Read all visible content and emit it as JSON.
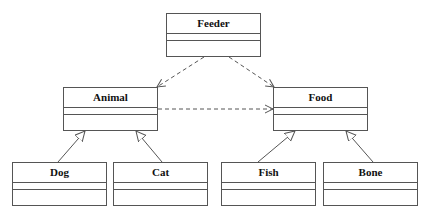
{
  "diagram": {
    "type": "UML class diagram",
    "classes": [
      {
        "id": "feeder",
        "name": "Feeder",
        "x": 166,
        "y": 13,
        "w": 95,
        "h": 44
      },
      {
        "id": "animal",
        "name": "Animal",
        "x": 63,
        "y": 87,
        "w": 95,
        "h": 44
      },
      {
        "id": "food",
        "name": "Food",
        "x": 273,
        "y": 87,
        "w": 95,
        "h": 44
      },
      {
        "id": "dog",
        "name": "Dog",
        "x": 12,
        "y": 162,
        "w": 95,
        "h": 44
      },
      {
        "id": "cat",
        "name": "Cat",
        "x": 113,
        "y": 162,
        "w": 95,
        "h": 44
      },
      {
        "id": "fish",
        "name": "Fish",
        "x": 221,
        "y": 162,
        "w": 95,
        "h": 44
      },
      {
        "id": "bone",
        "name": "Bone",
        "x": 323,
        "y": 162,
        "w": 95,
        "h": 44
      }
    ],
    "relationships": [
      {
        "type": "dependency",
        "from": "Feeder",
        "to": "Animal"
      },
      {
        "type": "dependency",
        "from": "Feeder",
        "to": "Food"
      },
      {
        "type": "dependency",
        "from": "Animal",
        "to": "Food"
      },
      {
        "type": "generalization",
        "from": "Dog",
        "to": "Animal"
      },
      {
        "type": "generalization",
        "from": "Cat",
        "to": "Animal"
      },
      {
        "type": "generalization",
        "from": "Fish",
        "to": "Food"
      },
      {
        "type": "generalization",
        "from": "Bone",
        "to": "Food"
      }
    ],
    "colors": {
      "line": "#555555",
      "text": "#111111",
      "background": "#ffffff"
    }
  }
}
